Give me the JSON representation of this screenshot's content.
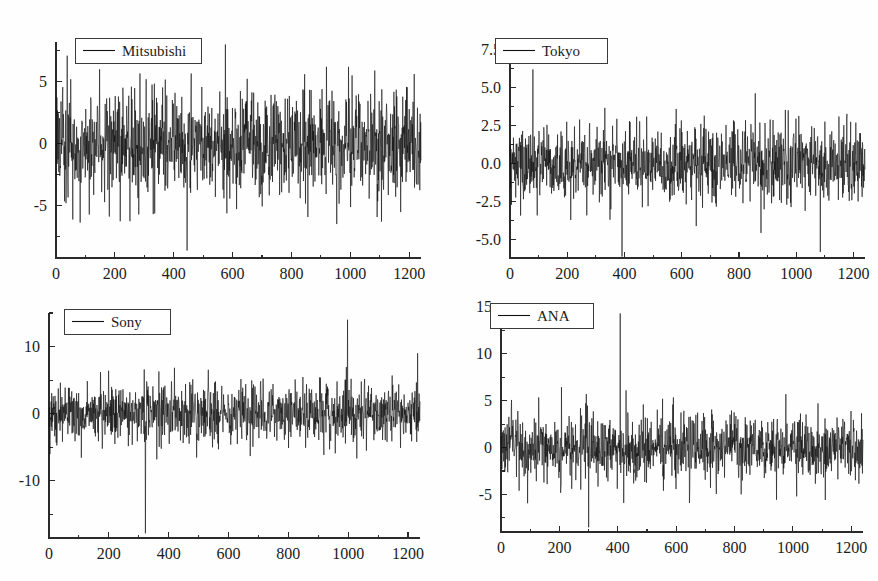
{
  "figure": {
    "background_color": "#fefefe",
    "line_color": "#111111",
    "axis_color": "#2a2a2a",
    "text_color": "#1c1c1c",
    "layout": "2x2 grid of time-series panels",
    "width": 878,
    "height": 581
  },
  "chart_data": [
    {
      "type": "line",
      "title": "",
      "legend_label": "Mitsubishi",
      "legend_position": "top-left",
      "xlabel": "",
      "ylabel": "",
      "xlim": [
        0,
        1240
      ],
      "ylim": [
        -9.2,
        8.2
      ],
      "xticks": [
        0,
        200,
        400,
        600,
        800,
        1000,
        1200
      ],
      "xtick_labels": [
        "0",
        "200",
        "400",
        "600",
        "800",
        "1000",
        "1200"
      ],
      "yticks": [
        -5,
        0,
        5
      ],
      "ytick_labels": [
        "-5",
        "0",
        "5"
      ],
      "minor_ytick_step": 2.5,
      "minor_xtick_step": 100,
      "grid": false,
      "n_points": 1240,
      "sigma": 1.45,
      "seed": 10427,
      "outliers": [
        {
          "x": 38,
          "y": 7.1
        },
        {
          "x": 57,
          "y": -6.1
        },
        {
          "x": 50,
          "y": 5.2
        },
        {
          "x": 113,
          "y": -5.7
        },
        {
          "x": 148,
          "y": 6.0
        },
        {
          "x": 165,
          "y": -4.7
        },
        {
          "x": 256,
          "y": 4.6
        },
        {
          "x": 445,
          "y": -8.6
        },
        {
          "x": 575,
          "y": 8.0
        },
        {
          "x": 580,
          "y": -5.6
        },
        {
          "x": 690,
          "y": -4.3
        },
        {
          "x": 918,
          "y": 6.2
        },
        {
          "x": 993,
          "y": 6.2
        },
        {
          "x": 1000,
          "y": -5.1
        },
        {
          "x": 1082,
          "y": 5.9
        },
        {
          "x": 1090,
          "y": -5.9
        },
        {
          "x": 1170,
          "y": -5.5
        }
      ]
    },
    {
      "type": "line",
      "title": "",
      "legend_label": "Tokyo",
      "legend_position": "top-left",
      "xlabel": "",
      "ylabel": "",
      "xlim": [
        0,
        1240
      ],
      "ylim": [
        -6.2,
        8.0
      ],
      "xticks": [
        0,
        200,
        400,
        600,
        800,
        1000,
        1200
      ],
      "xtick_labels": [
        "0",
        "200",
        "400",
        "600",
        "800",
        "1000",
        "1200"
      ],
      "yticks": [
        -5.0,
        -2.5,
        0.0,
        2.5,
        5.0,
        7.5
      ],
      "ytick_labels": [
        "-5.0",
        "-2.5",
        "0.0",
        "2.5",
        "5.0",
        "7.5"
      ],
      "minor_ytick_step": 1.25,
      "minor_xtick_step": 100,
      "grid": false,
      "n_points": 1240,
      "sigma": 0.82,
      "seed": 77310,
      "outliers": [
        {
          "x": 80,
          "y": 6.2
        },
        {
          "x": 5,
          "y": -2.7
        },
        {
          "x": 95,
          "y": -3.4
        },
        {
          "x": 212,
          "y": -3.7
        },
        {
          "x": 243,
          "y": 2.9
        },
        {
          "x": 268,
          "y": -3.4
        },
        {
          "x": 352,
          "y": -3.0
        },
        {
          "x": 417,
          "y": 2.8
        },
        {
          "x": 580,
          "y": 3.6
        },
        {
          "x": 672,
          "y": -2.9
        },
        {
          "x": 718,
          "y": -2.6
        },
        {
          "x": 908,
          "y": 2.9
        },
        {
          "x": 913,
          "y": -2.6
        },
        {
          "x": 1030,
          "y": -3.1
        },
        {
          "x": 1083,
          "y": -5.8
        },
        {
          "x": 1148,
          "y": 3.1
        },
        {
          "x": 1175,
          "y": 3.0
        }
      ]
    },
    {
      "type": "line",
      "title": "",
      "legend_label": "Sony",
      "legend_position": "top-left",
      "xlabel": "",
      "ylabel": "",
      "xlim": [
        0,
        1240
      ],
      "ylim": [
        -18.5,
        15.0
      ],
      "xticks": [
        0,
        200,
        400,
        600,
        800,
        1000,
        1200
      ],
      "xtick_labels": [
        "0",
        "200",
        "400",
        "600",
        "800",
        "1000",
        "1200"
      ],
      "yticks": [
        -10,
        0,
        10
      ],
      "ytick_labels": [
        "-10",
        "0",
        "10"
      ],
      "minor_ytick_step": 5,
      "minor_xtick_step": 100,
      "grid": false,
      "n_points": 1240,
      "sigma": 1.5,
      "seed": 51988,
      "outliers": [
        {
          "x": 3,
          "y": -6.0
        },
        {
          "x": 172,
          "y": 6.2
        },
        {
          "x": 178,
          "y": -5.2
        },
        {
          "x": 322,
          "y": -17.8
        },
        {
          "x": 318,
          "y": 6.6
        },
        {
          "x": 367,
          "y": 6.3
        },
        {
          "x": 566,
          "y": -5.3
        },
        {
          "x": 607,
          "y": -4.6
        },
        {
          "x": 800,
          "y": -5.1
        },
        {
          "x": 822,
          "y": 5.1
        },
        {
          "x": 997,
          "y": 14.0
        },
        {
          "x": 1009,
          "y": 5.2
        },
        {
          "x": 1060,
          "y": -5.5
        },
        {
          "x": 1148,
          "y": 4.3
        }
      ]
    },
    {
      "type": "line",
      "title": "",
      "legend_label": "ANA",
      "legend_position": "top-left",
      "xlabel": "",
      "ylabel": "",
      "xlim": [
        0,
        1240
      ],
      "ylim": [
        -9.0,
        15.2
      ],
      "xticks": [
        0,
        200,
        400,
        600,
        800,
        1000,
        1200
      ],
      "xtick_labels": [
        "0",
        "200",
        "400",
        "600",
        "800",
        "1000",
        "1200"
      ],
      "yticks": [
        -5,
        0,
        5,
        10,
        15
      ],
      "ytick_labels": [
        "-5",
        "0",
        "5",
        "10",
        "15"
      ],
      "minor_ytick_step": 2.5,
      "minor_xtick_step": 100,
      "grid": false,
      "n_points": 1240,
      "sigma": 1.15,
      "seed": 33165,
      "outliers": [
        {
          "x": 35,
          "y": 3.9
        },
        {
          "x": 62,
          "y": -4.6
        },
        {
          "x": 58,
          "y": 3.9
        },
        {
          "x": 205,
          "y": -4.3
        },
        {
          "x": 242,
          "y": -4.4
        },
        {
          "x": 272,
          "y": 4.2
        },
        {
          "x": 300,
          "y": -8.5
        },
        {
          "x": 292,
          "y": 5.7
        },
        {
          "x": 408,
          "y": 14.3
        },
        {
          "x": 420,
          "y": -5.9
        },
        {
          "x": 428,
          "y": 6.1
        },
        {
          "x": 487,
          "y": 4.6
        },
        {
          "x": 553,
          "y": 5.2
        },
        {
          "x": 556,
          "y": -4.6
        },
        {
          "x": 975,
          "y": 5.7
        },
        {
          "x": 1012,
          "y": -5.2
        },
        {
          "x": 1198,
          "y": 3.9
        }
      ]
    }
  ]
}
